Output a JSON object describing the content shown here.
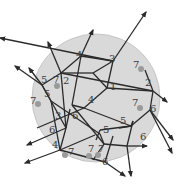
{
  "figure": {
    "type": "graph-on-disk",
    "disk": {
      "cx": 96,
      "cy": 98,
      "r": 64,
      "fill": "#d9d9d9",
      "stroke": "#bdbdbd"
    },
    "colors": {
      "edge": "#2a2a2a",
      "label": "#3a3a3a",
      "dot": "#9a9a9a"
    },
    "labels": [
      {
        "text": "4",
        "x": 76,
        "y": 58
      },
      {
        "text": "3",
        "x": 109,
        "y": 62
      },
      {
        "text": "7",
        "x": 133,
        "y": 68
      },
      {
        "text": "2",
        "x": 145,
        "y": 86
      },
      {
        "text": "1",
        "x": 110,
        "y": 90
      },
      {
        "text": "5",
        "x": 41,
        "y": 83
      },
      {
        "text": "7",
        "x": 53,
        "y": 83
      },
      {
        "text": "2",
        "x": 63,
        "y": 84
      },
      {
        "text": "7",
        "x": 30,
        "y": 104
      },
      {
        "text": "5",
        "x": 44,
        "y": 97
      },
      {
        "text": "4",
        "x": 88,
        "y": 103
      },
      {
        "text": "7",
        "x": 132,
        "y": 106
      },
      {
        "text": "6",
        "x": 150,
        "y": 112
      },
      {
        "text": "3",
        "x": 55,
        "y": 119
      },
      {
        "text": "6",
        "x": 72,
        "y": 119
      },
      {
        "text": "5",
        "x": 120,
        "y": 124
      },
      {
        "text": "5",
        "x": 103,
        "y": 133
      },
      {
        "text": "6",
        "x": 49,
        "y": 133
      },
      {
        "text": "6",
        "x": 140,
        "y": 140
      },
      {
        "text": "4",
        "x": 52,
        "y": 148
      },
      {
        "text": "7",
        "x": 68,
        "y": 155
      },
      {
        "text": "7",
        "x": 88,
        "y": 152
      },
      {
        "text": "7",
        "x": 98,
        "y": 152
      },
      {
        "text": "6",
        "x": 102,
        "y": 165
      }
    ],
    "dots": [
      {
        "x": 141,
        "y": 69
      },
      {
        "x": 57,
        "y": 86
      },
      {
        "x": 38,
        "y": 104
      },
      {
        "x": 140,
        "y": 108
      },
      {
        "x": 65,
        "y": 155
      },
      {
        "x": 89,
        "y": 156
      },
      {
        "x": 98,
        "y": 155
      }
    ],
    "edges": [
      [
        61,
        73,
        153,
        91
      ],
      [
        61,
        73,
        48,
        42
      ],
      [
        61,
        73,
        81,
        56
      ],
      [
        61,
        73,
        42,
        85
      ],
      [
        61,
        73,
        66,
        128
      ],
      [
        61,
        73,
        93,
        73
      ],
      [
        81,
        56,
        113,
        61
      ],
      [
        81,
        56,
        72,
        105
      ],
      [
        81,
        56,
        93,
        30
      ],
      [
        113,
        61,
        107,
        88
      ],
      [
        113,
        61,
        93,
        73
      ],
      [
        113,
        61,
        146,
        12
      ],
      [
        113,
        61,
        0,
        38
      ],
      [
        107,
        88,
        153,
        91
      ],
      [
        107,
        88,
        93,
        73
      ],
      [
        153,
        91,
        167,
        102
      ],
      [
        153,
        91,
        145,
        70
      ],
      [
        153,
        91,
        150,
        110
      ],
      [
        150,
        110,
        173,
        140
      ],
      [
        150,
        110,
        131,
        126
      ],
      [
        150,
        110,
        172,
        153
      ],
      [
        131,
        126,
        119,
        128
      ],
      [
        131,
        126,
        100,
        130
      ],
      [
        131,
        126,
        84,
        108
      ],
      [
        42,
        85,
        15,
        66
      ],
      [
        42,
        85,
        29,
        68
      ],
      [
        42,
        85,
        51,
        101
      ],
      [
        42,
        85,
        66,
        128
      ],
      [
        51,
        101,
        60,
        150
      ],
      [
        51,
        101,
        100,
        134
      ],
      [
        66,
        128,
        70,
        109
      ],
      [
        66,
        128,
        27,
        145
      ],
      [
        66,
        128,
        60,
        150
      ],
      [
        72,
        105,
        104,
        144
      ],
      [
        72,
        105,
        84,
        108
      ],
      [
        84,
        108,
        107,
        88
      ],
      [
        84,
        108,
        37,
        128
      ],
      [
        60,
        150,
        25,
        163
      ],
      [
        60,
        150,
        105,
        162
      ],
      [
        60,
        150,
        95,
        135
      ],
      [
        100,
        130,
        96,
        140
      ],
      [
        100,
        134,
        104,
        144
      ],
      [
        104,
        144,
        127,
        146
      ],
      [
        127,
        146,
        147,
        146
      ],
      [
        127,
        146,
        133,
        121
      ],
      [
        133,
        121,
        131,
        126
      ],
      [
        127,
        146,
        131,
        176
      ],
      [
        104,
        144,
        93,
        160
      ],
      [
        105,
        162,
        125,
        176
      ],
      [
        105,
        162,
        113,
        136
      ]
    ]
  }
}
